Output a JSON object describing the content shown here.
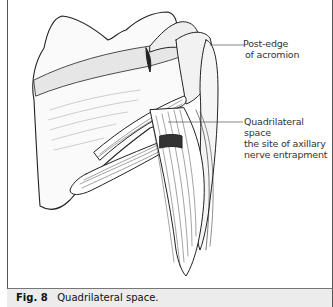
{
  "figure": {
    "number_label": "Fig. 8",
    "caption": "Quadrilateral space.",
    "illustration": "Posterior view of shoulder: scapula, acromion, humerus with teres muscles and triceps long head forming the quadrilateral space",
    "annotations": [
      {
        "id": "post-edge-acromion",
        "lines": [
          "Post-edge",
          "of acromion"
        ]
      },
      {
        "id": "quadrilateral-space",
        "lines": [
          "Quadrilateral space",
          "the site of axillary",
          "nerve entrapment"
        ]
      }
    ]
  }
}
